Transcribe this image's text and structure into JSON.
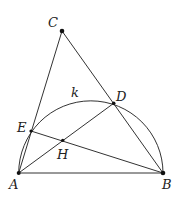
{
  "diagram": {
    "type": "geometry",
    "colors": {
      "stroke": "#333333",
      "point": "#111111",
      "label": "#222222",
      "background": "#ffffff"
    },
    "points": {
      "A": {
        "x": 18.7,
        "y": 173,
        "label": "A",
        "label_x": 9,
        "label_y": 189,
        "dot_r": 2
      },
      "B": {
        "x": 163,
        "y": 173,
        "label": "B",
        "label_x": 162,
        "label_y": 189,
        "dot_r": 2.3
      },
      "C": {
        "x": 62,
        "y": 31,
        "label": "C",
        "label_x": 48,
        "label_y": 27,
        "dot_r": 2.3
      },
      "D": {
        "x": 113.7,
        "y": 103.3,
        "label": "D",
        "label_x": 116,
        "label_y": 101,
        "dot_r": 1.8
      },
      "E": {
        "x": 31,
        "y": 131,
        "label": "E",
        "label_x": 17,
        "label_y": 132,
        "dot_r": 1.6
      },
      "H": {
        "x": 62.7,
        "y": 140.3,
        "label": "H",
        "label_x": 57,
        "label_y": 159,
        "dot_r": 1.6
      }
    },
    "arc": {
      "name": "k",
      "label": "k",
      "label_x": 71,
      "label_y": 97,
      "cx": 90.85,
      "cy": 173,
      "r": 72.15
    },
    "segments": [
      [
        "A",
        "B"
      ],
      [
        "A",
        "C"
      ],
      [
        "B",
        "C"
      ],
      [
        "A",
        "D"
      ],
      [
        "B",
        "E"
      ]
    ]
  }
}
